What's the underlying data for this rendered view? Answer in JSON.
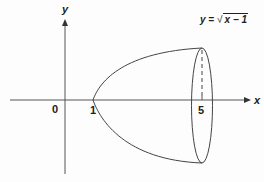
{
  "diagram": {
    "axes": {
      "x_label": "x",
      "y_label": "y"
    },
    "ticks": {
      "origin": "0",
      "one": "1",
      "five": "5"
    },
    "equation": {
      "lhs": "y =",
      "radicand": "x − 1",
      "sqrt_symbol": "√"
    },
    "colors": {
      "axis": "#555555",
      "curve": "#444444",
      "text": "#222222"
    }
  }
}
